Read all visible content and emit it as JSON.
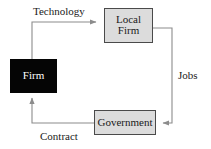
{
  "diagram": {
    "colors": {
      "firm_fill": "#050505",
      "firm_text": "#ffffff",
      "node_fill": "#dcdcdc",
      "node_stroke": "#4a4a4a",
      "line": "#8c8c8c",
      "text": "#1a1a1a",
      "background": "#ffffff"
    },
    "nodes": [
      {
        "id": "firm",
        "label": "Firm",
        "style": "filled-black"
      },
      {
        "id": "local_firm",
        "label_line1": "Local",
        "label_line2": "Firm",
        "style": "filled-gray"
      },
      {
        "id": "government",
        "label": "Government",
        "style": "filled-gray"
      }
    ],
    "edges": [
      {
        "id": "technology",
        "label": "Technology",
        "from": "firm",
        "to": "local_firm",
        "direction": "right"
      },
      {
        "id": "jobs",
        "label": "Jobs",
        "from": "local_firm",
        "to": "government",
        "direction": "down"
      },
      {
        "id": "contract",
        "label": "Contract",
        "from": "government",
        "to": "firm",
        "direction": "up"
      }
    ]
  }
}
